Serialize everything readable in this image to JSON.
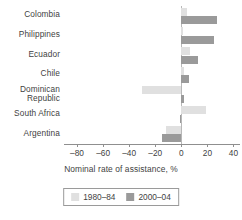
{
  "chart_data": {
    "type": "bar",
    "orientation": "horizontal",
    "title": "",
    "xlabel": "Nominal rate of assistance, %",
    "ylabel": "",
    "xlim": [
      -90,
      45
    ],
    "xticks": [
      -80,
      -60,
      -40,
      -20,
      0,
      20,
      40
    ],
    "xtick_labels": [
      "–80",
      "–60",
      "–40",
      "–20",
      "0",
      "20",
      "40"
    ],
    "grid": false,
    "legend_position": "bottom",
    "categories": [
      "Colombia",
      "Philippines",
      "Ecuador",
      "Chile",
      "Dominican\nRepublic",
      "South Africa",
      "Argentina"
    ],
    "series": [
      {
        "name": "1980–84",
        "color": "#e0e0e0",
        "values": [
          4,
          1,
          7,
          2,
          -30,
          19,
          -12
        ]
      },
      {
        "name": "2000–04",
        "color": "#9a9a9a",
        "values": [
          27,
          25,
          13,
          6,
          2,
          -1,
          -15
        ]
      }
    ]
  },
  "legend": {
    "items": [
      {
        "label": "1980–84",
        "color": "#e0e0e0"
      },
      {
        "label": "2000–04",
        "color": "#9a9a9a"
      }
    ]
  },
  "colors": {
    "period_1980_84": "#e0e0e0",
    "period_2000_04": "#9a9a9a",
    "axis": "#8f8f8f",
    "text": "#3f3f3f",
    "background": "#ffffff"
  }
}
